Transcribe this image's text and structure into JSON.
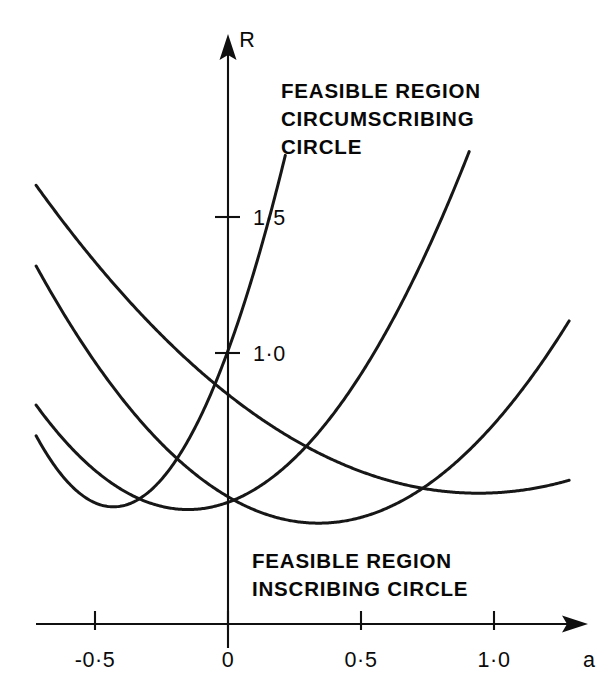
{
  "chart_data": {
    "type": "line",
    "title": "",
    "subtitle": "",
    "xlabel": "a",
    "ylabel": "R",
    "xlim": [
      -0.72,
      1.28
    ],
    "ylim": [
      0.0,
      1.85
    ],
    "grid": false,
    "legend": null,
    "xticks": [
      -0.5,
      0,
      0.5,
      1.0
    ],
    "xticklabels": [
      "-0·5",
      "0",
      "0·5",
      "1·0"
    ],
    "yticks": [
      1.0,
      1.5
    ],
    "yticklabels": [
      "1·0",
      "1·5"
    ],
    "annotations": [
      {
        "name": "upper-region-label",
        "lines": [
          "FEASIBLE REGION",
          "CIRCUMSCRIBING",
          "CIRCLE"
        ],
        "x": 0.2,
        "y": 1.72
      },
      {
        "name": "lower-region-label",
        "lines": [
          "FEASIBLE REGION",
          "INSCRIBING CIRCLE"
        ],
        "x": 0.33,
        "y": 0.27
      }
    ],
    "series": [
      {
        "name": "curve-1",
        "comment": "steepest parabola, passes through (0, 1.0)",
        "vertex_x": -0.43,
        "vertex_y": 0.43,
        "curvature": 3.1,
        "x_start": -0.72,
        "x_end": 1.28,
        "points": [
          [
            -0.72,
            0.69
          ],
          [
            -0.6,
            0.52
          ],
          [
            -0.5,
            0.45
          ],
          [
            -0.43,
            0.43
          ],
          [
            -0.3,
            0.48
          ],
          [
            -0.2,
            0.59
          ],
          [
            -0.1,
            0.77
          ],
          [
            0.0,
            1.0
          ],
          [
            0.1,
            1.3
          ],
          [
            0.2,
            1.65
          ],
          [
            0.28,
            1.99
          ],
          [
            0.4,
            2.59
          ]
        ]
      },
      {
        "name": "curve-2",
        "comment": "medium-steep parabola",
        "vertex_x": -0.15,
        "vertex_y": 0.42,
        "curvature": 1.18,
        "x_start": -0.72,
        "x_end": 1.28,
        "points": [
          [
            -0.72,
            0.81
          ],
          [
            -0.6,
            0.66
          ],
          [
            -0.4,
            0.49
          ],
          [
            -0.25,
            0.43
          ],
          [
            -0.15,
            0.42
          ],
          [
            0.0,
            0.45
          ],
          [
            0.2,
            0.57
          ],
          [
            0.4,
            0.78
          ],
          [
            0.6,
            1.08
          ],
          [
            0.8,
            1.47
          ],
          [
            1.0,
            1.95
          ],
          [
            1.28,
            2.78
          ]
        ]
      },
      {
        "name": "curve-3",
        "comment": "parabola with the lowest minimum, dips below the others",
        "vertex_x": 0.34,
        "vertex_y": 0.37,
        "curvature": 0.84,
        "x_start": -0.72,
        "x_end": 1.28,
        "points": [
          [
            -0.72,
            1.32
          ],
          [
            -0.5,
            0.99
          ],
          [
            -0.25,
            0.67
          ],
          [
            0.0,
            0.47
          ],
          [
            0.15,
            0.4
          ],
          [
            0.34,
            0.37
          ],
          [
            0.5,
            0.39
          ],
          [
            0.7,
            0.49
          ],
          [
            0.9,
            0.67
          ],
          [
            1.1,
            0.93
          ],
          [
            1.28,
            1.22
          ]
        ]
      },
      {
        "name": "curve-4",
        "comment": "flattest parabola, minimum furthest right",
        "vertex_x": 0.94,
        "vertex_y": 0.48,
        "curvature": 0.41,
        "x_start": -0.72,
        "x_end": 1.28,
        "points": [
          [
            -0.72,
            1.61
          ],
          [
            -0.5,
            1.31
          ],
          [
            -0.25,
            1.0
          ],
          [
            0.0,
            0.74
          ],
          [
            0.25,
            0.54
          ],
          [
            0.5,
            0.41
          ],
          [
            0.75,
            0.35
          ],
          [
            0.94,
            0.48
          ],
          [
            1.0,
            0.49
          ],
          [
            1.15,
            0.54
          ],
          [
            1.28,
            0.62
          ]
        ]
      }
    ]
  },
  "labels": {
    "y_axis_symbol": "R",
    "x_axis_symbol": "a"
  }
}
